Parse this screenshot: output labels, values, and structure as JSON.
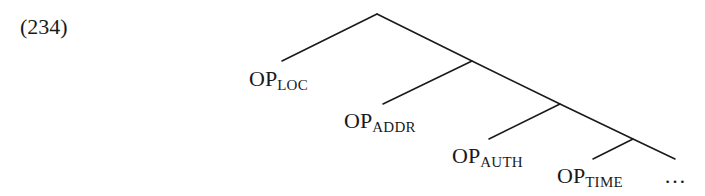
{
  "example": {
    "number": "(234)"
  },
  "tree": {
    "line_color": "#1a1a1a",
    "root": {
      "x": 377,
      "y": 14
    },
    "spine": [
      {
        "x": 377,
        "y": 14
      },
      {
        "x": 472,
        "y": 61
      },
      {
        "x": 560,
        "y": 104
      },
      {
        "x": 633,
        "y": 139
      },
      {
        "x": 675,
        "y": 159
      }
    ],
    "branches": [
      {
        "from": {
          "x": 377,
          "y": 14
        },
        "to": {
          "x": 282,
          "y": 61
        }
      },
      {
        "from": {
          "x": 472,
          "y": 61
        },
        "to": {
          "x": 383,
          "y": 104
        }
      },
      {
        "from": {
          "x": 560,
          "y": 104
        },
        "to": {
          "x": 489,
          "y": 139
        }
      },
      {
        "from": {
          "x": 633,
          "y": 139
        },
        "to": {
          "x": 593,
          "y": 159
        }
      }
    ],
    "nodes": [
      {
        "base": "OP",
        "sub": "LOC"
      },
      {
        "base": "OP",
        "sub": "ADDR"
      },
      {
        "base": "OP",
        "sub": "AUTH"
      },
      {
        "base": "OP",
        "sub": "TIME"
      }
    ],
    "continuation": "…"
  }
}
